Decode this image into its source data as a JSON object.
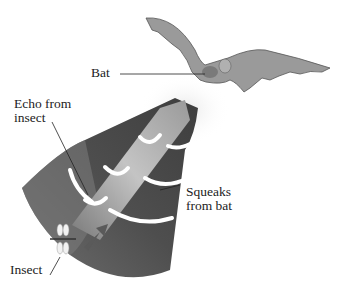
{
  "diagram": {
    "labels": {
      "bat": "Bat",
      "echo_line1": "Echo from",
      "echo_line2": "insect",
      "squeaks_line1": "Squeaks",
      "squeaks_line2": "from bat",
      "insect": "Insect"
    },
    "colors": {
      "background": "#ffffff",
      "cone_dark": "#4a4a4a",
      "cone_mid": "#6a6a6a",
      "echo_beam": "#a8a8a8",
      "wave_arc": "#ffffff",
      "bat_body": "#8a8a8a",
      "text": "#222222"
    },
    "icons": [
      "bat-icon",
      "insect-icon",
      "arrow-icon"
    ]
  }
}
